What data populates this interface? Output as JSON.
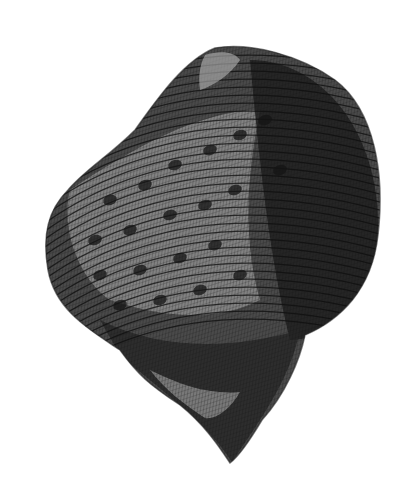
{
  "image": {
    "subject": "Engraved illustration of a spiral sea snail shell",
    "description": "Cross-hatched black-and-white engraving of a rounded gastropod shell with spiral ridges and dark mottled bands, pointed apex at the bottom",
    "colors": {
      "background": "#ffffff",
      "shell_dark": "#1e1e1e",
      "shell_mid": "#4a4a4a",
      "shell_light": "#8c8c8c",
      "highlight": "#b5b5b5"
    }
  }
}
